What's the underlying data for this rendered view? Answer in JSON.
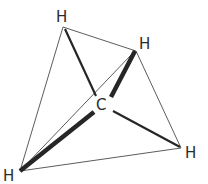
{
  "diagram": {
    "molecule": "methane",
    "colors": {
      "background": "#ffffff",
      "edge": "#4a4a4a",
      "bond": "#262626",
      "label": "#2b2b2b"
    },
    "atoms": [
      {
        "id": "C",
        "label": "C",
        "x": 102,
        "y": 110
      },
      {
        "id": "H1",
        "label": "H",
        "x": 61,
        "y": 22
      },
      {
        "id": "H2",
        "label": "H",
        "x": 144,
        "y": 49
      },
      {
        "id": "H3",
        "label": "H",
        "x": 191,
        "y": 157
      },
      {
        "id": "H4",
        "label": "H",
        "x": 10,
        "y": 180
      }
    ]
  }
}
